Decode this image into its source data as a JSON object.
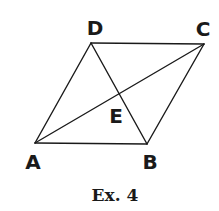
{
  "figure": {
    "caption": "Ex. 4",
    "shape": "parallelogram",
    "vertices": {
      "A": {
        "label": "A",
        "x": 35,
        "y": 143
      },
      "B": {
        "label": "B",
        "x": 147,
        "y": 144
      },
      "C": {
        "label": "C",
        "x": 204,
        "y": 44
      },
      "D": {
        "label": "D",
        "x": 91,
        "y": 43
      }
    },
    "intersection": {
      "label": "E",
      "x": 120,
      "y": 95
    },
    "edges": [
      {
        "from": "A",
        "to": "B"
      },
      {
        "from": "B",
        "to": "C"
      },
      {
        "from": "C",
        "to": "D"
      },
      {
        "from": "D",
        "to": "A"
      }
    ],
    "diagonals": [
      {
        "from": "A",
        "to": "C"
      },
      {
        "from": "D",
        "to": "B"
      }
    ],
    "line_color": "#1a1a1a"
  }
}
